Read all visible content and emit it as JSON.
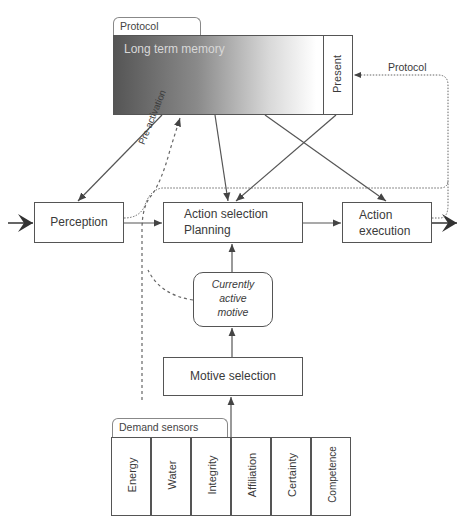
{
  "diagram": {
    "protocol_memory": {
      "tab_label": "Protocol memory",
      "long_term_label": "Long term memory",
      "present_label": "Present"
    },
    "protocol_arrow_label": "Protocol",
    "preactivation_label": "Pre-activation",
    "perception_label": "Perception",
    "action_selection": {
      "line1": "Action selection",
      "line2": "Planning"
    },
    "action_execution": {
      "line1": "Action",
      "line2": "execution"
    },
    "currently_active_motive": {
      "line1": "Currently",
      "line2": "active",
      "line3": "motive"
    },
    "motive_selection_label": "Motive selection",
    "demand_sensors": {
      "tab_label": "Demand sensors",
      "items": [
        "Energy",
        "Water",
        "Integrity",
        "Affiliation",
        "Certainty",
        "Competence"
      ]
    }
  }
}
